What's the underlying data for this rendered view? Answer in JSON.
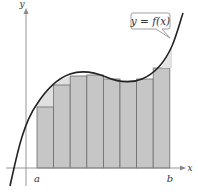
{
  "figure": {
    "type": "riemann-sum",
    "function_label": "y = f(x)",
    "x_axis_label": "x",
    "y_axis_label": "y",
    "interval_start_label": "a",
    "interval_end_label": "b",
    "num_rectangles": 8,
    "rectangle_tops_px": [
      107,
      85,
      76,
      75,
      79,
      81,
      79,
      68
    ],
    "colors": {
      "rect_fill": "#c8c8c8",
      "rect_stroke": "#6e6e6e",
      "excess_fill": "#e2e2e2",
      "curve": "#222222",
      "axis": "#8a8a8a",
      "label_box_stroke": "#888888"
    }
  }
}
